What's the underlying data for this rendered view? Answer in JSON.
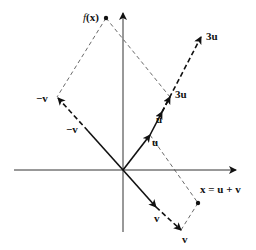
{
  "diagram": {
    "labels": {
      "fx_name": "f",
      "fx_arg": "(x)",
      "neg_v_outer": "−v",
      "neg_v_inner": "−v",
      "three_u_top": "3u",
      "three_u_mid": "3u",
      "u_upper": "u",
      "u_lower": "u",
      "x_eq": "x = u + v",
      "v_inner": "v",
      "v_outer": "v"
    },
    "points": {
      "origin": [
        123,
        170
      ],
      "u": [
        150,
        135
      ],
      "u2": [
        170,
        97
      ],
      "three_u": [
        201,
        37
      ],
      "neg_v": [
        57,
        97
      ],
      "v": [
        181,
        230
      ],
      "x": [
        198,
        203
      ],
      "fx": [
        106,
        18
      ]
    },
    "colors": {
      "ink": "#111111",
      "dashed": "#444444"
    }
  }
}
